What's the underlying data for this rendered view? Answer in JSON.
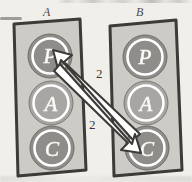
{
  "figure": {
    "kind": "hand-drawn-sketch-diagram",
    "background_color": "#f1efea",
    "panels": [
      {
        "label": "A",
        "fill_color": "#cdcbc6",
        "stroke_color": "#3c3a38",
        "nodes": [
          {
            "label": "P",
            "fill_color": "#8f8d8a",
            "text_color": "#ffffff",
            "ring_color": "#ffffff"
          },
          {
            "label": "A",
            "fill_color": "#a8a6a2",
            "text_color": "#ffffff",
            "ring_color": "#ffffff"
          },
          {
            "label": "C",
            "fill_color": "#8f8d8a",
            "text_color": "#ffffff",
            "ring_color": "#ffffff"
          }
        ]
      },
      {
        "label": "B",
        "fill_color": "#cdcbc6",
        "stroke_color": "#3c3a38",
        "nodes": [
          {
            "label": "P",
            "fill_color": "#8f8d8a",
            "text_color": "#ffffff",
            "ring_color": "#ffffff"
          },
          {
            "label": "A",
            "fill_color": "#a8a6a2",
            "text_color": "#ffffff",
            "ring_color": "#ffffff"
          },
          {
            "label": "C",
            "fill_color": "#8f8d8a",
            "text_color": "#ffffff",
            "ring_color": "#ffffff"
          }
        ]
      }
    ],
    "arrows": [
      {
        "id": "arrow-b-c-to-a-p",
        "label": "2",
        "from": "B.C",
        "to": "A.P",
        "fill_color": "#ffffff",
        "stroke_color": "#3c3a38"
      },
      {
        "id": "arrow-a-p-to-b-c",
        "label": "2",
        "from": "A.P",
        "to": "B.C",
        "fill_color": "#ffffff",
        "stroke_color": "#3c3a38"
      }
    ],
    "arrow_labels": {
      "top": "2",
      "bottom": "2"
    }
  }
}
